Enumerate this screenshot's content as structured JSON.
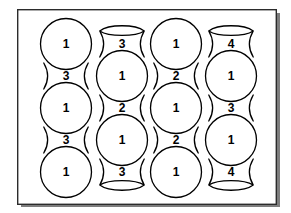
{
  "figure": {
    "title": "",
    "background_color": "#ffffff",
    "line_color": "#000000",
    "frame_color": "#2b2b2b",
    "frame": {
      "x": 17,
      "y": 9,
      "width": 259,
      "height": 195
    },
    "geometry": {
      "column_centers_x": [
        66,
        122,
        176,
        231
      ],
      "row_pitch": 64,
      "sphere_radius": 25.5,
      "neck_half_height": 13,
      "neck_waist_half_width": 14.5
    },
    "columns": [
      {
        "index": 1,
        "center_x": 66,
        "offset": "sphere-first",
        "units": [
          {
            "type": "sphere",
            "label": "1",
            "center_y": 44
          },
          {
            "type": "neck",
            "label": "3",
            "center_y": 76
          },
          {
            "type": "sphere",
            "label": "1",
            "center_y": 108
          },
          {
            "type": "neck",
            "label": "3",
            "center_y": 140
          },
          {
            "type": "sphere",
            "label": "1",
            "center_y": 172
          }
        ]
      },
      {
        "index": 2,
        "center_x": 122,
        "offset": "neck-first",
        "units": [
          {
            "type": "neck-open-top",
            "label": "3",
            "center_y": 44
          },
          {
            "type": "sphere",
            "label": "1",
            "center_y": 76
          },
          {
            "type": "neck",
            "label": "2",
            "center_y": 108
          },
          {
            "type": "sphere",
            "label": "1",
            "center_y": 140
          },
          {
            "type": "neck-open-bottom",
            "label": "3",
            "center_y": 172
          }
        ]
      },
      {
        "index": 3,
        "center_x": 176,
        "offset": "sphere-first",
        "units": [
          {
            "type": "sphere",
            "label": "1",
            "center_y": 44
          },
          {
            "type": "neck",
            "label": "2",
            "center_y": 76
          },
          {
            "type": "sphere",
            "label": "1",
            "center_y": 108
          },
          {
            "type": "neck",
            "label": "2",
            "center_y": 140
          },
          {
            "type": "sphere",
            "label": "1",
            "center_y": 172
          }
        ]
      },
      {
        "index": 4,
        "center_x": 231,
        "offset": "neck-first",
        "units": [
          {
            "type": "neck-open-top",
            "label": "4",
            "center_y": 44
          },
          {
            "type": "sphere",
            "label": "1",
            "center_y": 76
          },
          {
            "type": "neck",
            "label": "3",
            "center_y": 108
          },
          {
            "type": "sphere",
            "label": "1",
            "center_y": 140
          },
          {
            "type": "neck-open-bottom",
            "label": "4",
            "center_y": 172
          }
        ]
      }
    ],
    "labels_flat": [
      "1",
      "3",
      "1",
      "3",
      "1",
      "3",
      "1",
      "2",
      "1",
      "3",
      "1",
      "2",
      "1",
      "2",
      "1",
      "4",
      "1",
      "3",
      "1",
      "4"
    ]
  }
}
